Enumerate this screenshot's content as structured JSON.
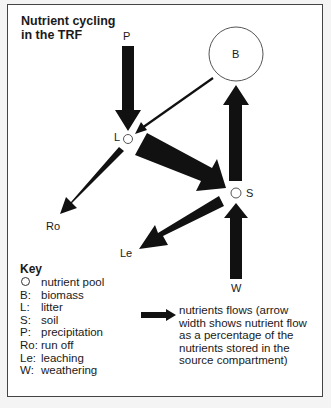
{
  "title": {
    "line1": "Nutrient cycling",
    "line2": "in the TRF"
  },
  "nodes": {
    "B": "B",
    "L": "L",
    "S": "S",
    "P": "P",
    "Ro": "Ro",
    "Le": "Le",
    "W": "W"
  },
  "flows": [
    {
      "from": "P",
      "to": "L",
      "width": "thick"
    },
    {
      "from": "B",
      "to": "L",
      "width": "thin"
    },
    {
      "from": "L",
      "to": "Ro",
      "width": "medium"
    },
    {
      "from": "L",
      "to": "S",
      "width": "very thick"
    },
    {
      "from": "S",
      "to": "B",
      "width": "thick"
    },
    {
      "from": "S",
      "to": "Le",
      "width": "very thick"
    },
    {
      "from": "W",
      "to": "S",
      "width": "thick"
    }
  ],
  "key": {
    "title": "Key",
    "items": [
      {
        "abbr": "",
        "icon": "circle-icon",
        "desc": "nutrient pool"
      },
      {
        "abbr": "B:",
        "desc": "biomass"
      },
      {
        "abbr": "L:",
        "desc": "litter"
      },
      {
        "abbr": "S:",
        "desc": "soil"
      },
      {
        "abbr": "P:",
        "desc": "precipitation"
      },
      {
        "abbr": "Ro:",
        "desc": "run off"
      },
      {
        "abbr": "Le:",
        "desc": "leaching"
      },
      {
        "abbr": "W:",
        "desc": "weathering"
      }
    ],
    "flow_key": {
      "icon": "arrow-right-icon",
      "lines": [
        "nutrients flows (arrow",
        "width shows nutrient flow",
        "as a percentage of the",
        "nutrients stored in the",
        "source compartment)"
      ]
    }
  },
  "colors": {
    "arrow": "#111111",
    "frame": "#444444",
    "background": "#ffffff"
  }
}
